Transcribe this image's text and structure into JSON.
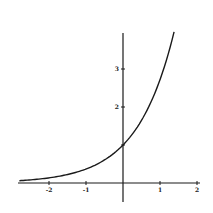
{
  "chart_data": {
    "type": "line",
    "title": "",
    "xlabel": "",
    "ylabel": "",
    "function": "y = e^x",
    "xlim": [
      -2.85,
      2.1
    ],
    "ylim": [
      -0.5,
      4.0
    ],
    "grid": false,
    "legend": null,
    "x_ticks": [
      {
        "value": -2,
        "label": "-2"
      },
      {
        "value": -1,
        "label": "-1"
      },
      {
        "value": 1,
        "label": "1"
      },
      {
        "value": 2,
        "label": "2"
      }
    ],
    "y_ticks": [
      {
        "value": 1,
        "label": ""
      },
      {
        "value": 2,
        "label": "2"
      },
      {
        "value": 3,
        "label": "3"
      }
    ],
    "series": [
      {
        "name": "exponential curve",
        "x": [
          -2.8,
          -2.5,
          -2.0,
          -1.5,
          -1.0,
          -0.5,
          0.0,
          0.25,
          0.5,
          0.75,
          1.0,
          1.2,
          1.38
        ],
        "values": [
          0.06,
          0.08,
          0.14,
          0.22,
          0.37,
          0.61,
          1.0,
          1.28,
          1.65,
          2.12,
          2.72,
          3.32,
          3.97
        ]
      }
    ],
    "colors": {
      "axis": "#1a1a1a",
      "curve": "#1a1a1a",
      "background": "#ffffff"
    }
  }
}
